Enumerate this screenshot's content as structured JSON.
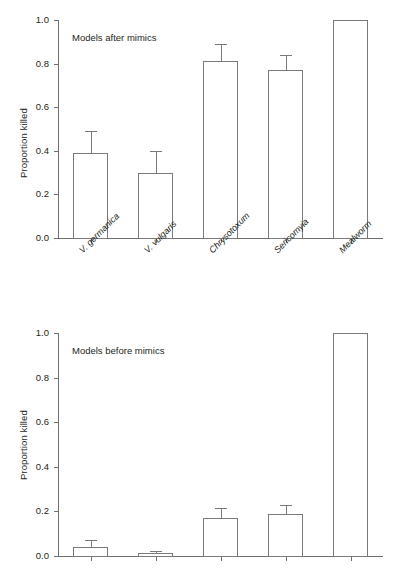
{
  "figure": {
    "ylabel": "Proportion killed"
  },
  "chart_data": [
    {
      "type": "bar",
      "title": "Models after mimics",
      "panel": "top",
      "xlabel": "",
      "ylabel": "Proportion killed",
      "ylim": [
        0.0,
        1.0
      ],
      "yticks": [
        "0.0",
        "0.2",
        "0.4",
        "0.6",
        "0.8",
        "1.0"
      ],
      "ytick_values": [
        0.0,
        0.2,
        0.4,
        0.6,
        0.8,
        1.0
      ],
      "grid": false,
      "legend": "none",
      "categories": [
        "V. germanica",
        "V. vulgaris",
        "Chrysotoxum",
        "Sericomyia",
        "Mealworm"
      ],
      "categories_italic": true,
      "values": [
        0.39,
        0.3,
        0.81,
        0.77,
        1.0
      ],
      "errors": [
        0.1,
        0.1,
        0.08,
        0.07,
        0.0
      ]
    },
    {
      "type": "bar",
      "title": "Models before mimics",
      "panel": "bottom",
      "xlabel": "",
      "ylabel": "Proportion killed",
      "ylim": [
        0.0,
        1.0
      ],
      "yticks": [
        "0.0",
        "0.2",
        "0.4",
        "0.6",
        "0.8",
        "1.0"
      ],
      "ytick_values": [
        0.0,
        0.2,
        0.4,
        0.6,
        0.8,
        1.0
      ],
      "grid": false,
      "legend": "none",
      "categories": [
        "",
        "",
        "",
        "",
        ""
      ],
      "categories_italic": false,
      "values": [
        0.04,
        0.013,
        0.17,
        0.19,
        1.0
      ],
      "errors": [
        0.032,
        0.01,
        0.045,
        0.04,
        0.0
      ]
    }
  ]
}
